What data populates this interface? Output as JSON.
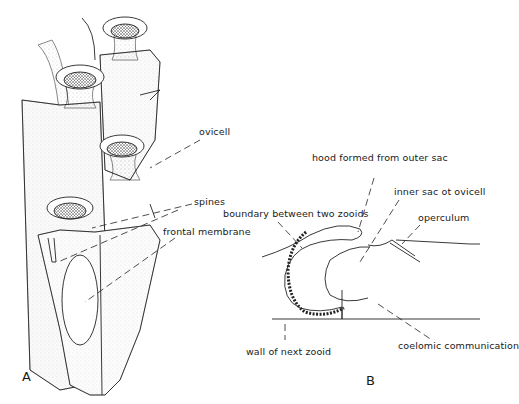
{
  "figure": {
    "panels": [
      {
        "id": "A",
        "letter": "A",
        "description": "Drawing of a bryozoan colony branch showing zooids",
        "labels": {
          "ovicell": "ovicell",
          "spines": "spines",
          "frontal_membrane": "frontal membrane"
        }
      },
      {
        "id": "B",
        "letter": "B",
        "description": "Schematic section of ovicell",
        "labels": {
          "hood": "hood formed from outer sac",
          "inner_sac": "inner sac ot ovicell",
          "boundary": "boundary between two zooids",
          "operculum": "operculum",
          "wall": "wall of next zooid",
          "coelomic": "coelomic communication"
        }
      }
    ]
  }
}
